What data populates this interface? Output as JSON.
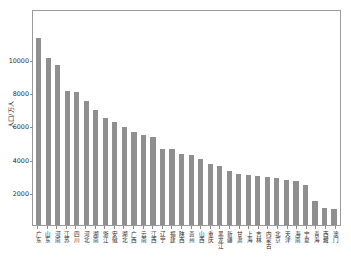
{
  "chart_data": {
    "type": "bar",
    "title": "",
    "xlabel": "",
    "ylabel": "人口/万人",
    "ylim": [
      0,
      13000
    ],
    "yticks": [
      2000,
      4000,
      6000,
      8000,
      10000
    ],
    "ytick_labels": [
      "2000",
      "4000",
      "6000",
      "8000",
      "10000"
    ],
    "grid": false,
    "legend": "none",
    "bar_color": "#8f8f8f",
    "frame_color": "#9a9a9a",
    "categories": [
      "广东",
      "山东",
      "河南",
      "江苏",
      "四川",
      "河北",
      "湖南",
      "浙江",
      "安徽",
      "湖北",
      "广西",
      "云南",
      "江西",
      "辽宁",
      "福建",
      "陕西",
      "贵州",
      "山西",
      "重庆",
      "黑龙江",
      "新疆",
      "甘肃",
      "上海",
      "吉林",
      "内蒙古",
      "北京",
      "天津",
      "海南",
      "宁夏",
      "青海",
      "西藏",
      "澳门"
    ],
    "values": [
      11250,
      10050,
      9650,
      8050,
      8000,
      7450,
      6900,
      6450,
      6200,
      5900,
      5600,
      5400,
      5300,
      4600,
      4550,
      4300,
      4200,
      3950,
      3700,
      3550,
      3250,
      3080,
      3000,
      2950,
      2900,
      2800,
      2700,
      2650,
      2400,
      1450,
      1050,
      950
    ]
  }
}
